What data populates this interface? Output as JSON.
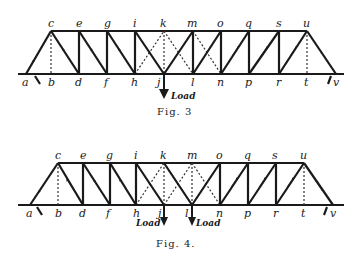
{
  "figures": [
    {
      "id": "fig3",
      "caption": "Fig. 3",
      "top_nodes": [
        "c",
        "e",
        "g",
        "i",
        "k",
        "m",
        "o",
        "q",
        "s",
        "u"
      ],
      "bottom_nodes": [
        "a",
        "b",
        "d",
        "f",
        "h",
        "j",
        "l",
        "n",
        "p",
        "r",
        "t",
        "v"
      ],
      "loads": [
        {
          "node": "j",
          "label": "Load"
        }
      ]
    },
    {
      "id": "fig4",
      "caption": "Fig. 4.",
      "top_nodes": [
        "c",
        "e",
        "g",
        "i",
        "k",
        "m",
        "o",
        "q",
        "s",
        "u"
      ],
      "bottom_nodes": [
        "a",
        "b",
        "d",
        "f",
        "h",
        "j",
        "l",
        "n",
        "p",
        "r",
        "t",
        "v"
      ],
      "loads": [
        {
          "node": "j",
          "label": "Load"
        },
        {
          "node": "l",
          "label": "Load"
        }
      ]
    }
  ],
  "labels": {
    "a": "a",
    "b": "b",
    "c": "c",
    "d": "d",
    "e": "e",
    "f": "f",
    "g": "g",
    "h": "h",
    "i": "i",
    "j": "j",
    "k": "k",
    "l": "l",
    "m": "m",
    "n": "n",
    "o": "o",
    "p": "p",
    "q": "q",
    "r": "r",
    "s": "s",
    "t": "t",
    "u": "u",
    "v": "v",
    "load": "Load"
  },
  "captions": {
    "fig3": "Fig. 3",
    "fig4": "Fig. 4."
  }
}
